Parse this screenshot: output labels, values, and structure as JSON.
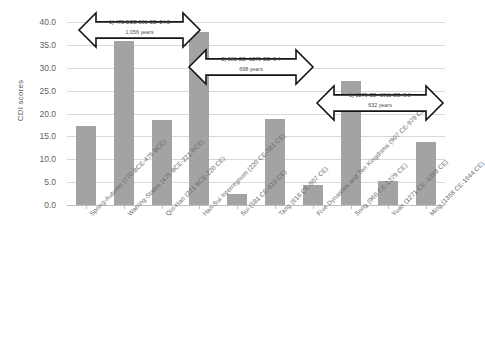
{
  "chart_data": {
    "type": "bar",
    "title": "",
    "xlabel": "",
    "ylabel": "CDI scores",
    "ylim": [
      0,
      40
    ],
    "ytick_labels": [
      "40.0",
      "35.0",
      "30.0",
      "25.0",
      "20.0",
      "15.0",
      "10.0",
      "5.0",
      "0.0"
    ],
    "ytick_values": [
      40,
      35,
      30,
      25,
      20,
      15,
      10,
      5,
      0
    ],
    "grid": true,
    "legend": "none",
    "bar_color": "#a3a3a3",
    "categories": [
      "Spring-Autumn (770 BCE-476 BCE)",
      "Warring-States (475 BCE-221 BCE)",
      "Qin-Han (221 BCE-220 CE)",
      "Han-Sui Interregnum (220 CE-581 CE)",
      "Sui (581 CE-618 CE)",
      "Tang (618 CE-907 CE)",
      "Five Dynasties and Ten Kingdoms (907 CE-979 CE)",
      "Song (960 CE-1279 CE)",
      "Yuan (1271 CE -1368 CE)",
      "Ming (1368 CE-1644 CE)"
    ],
    "values": [
      17.2,
      35.8,
      18.6,
      37.9,
      2.4,
      18.7,
      4.3,
      27.1,
      5.2,
      13.8
    ],
    "annotations": [
      {
        "id": 1,
        "line1": "1) 475 BCE-581 CE: 24.5",
        "line2": "1,056 years"
      },
      {
        "id": 2,
        "line1": "2) 581 CE- 1279 CE: 9.4",
        "line2": "698 years"
      },
      {
        "id": 3,
        "line1": "3) 1279 CE- 1911 CE: 5.3",
        "line2": "632 years"
      }
    ]
  }
}
